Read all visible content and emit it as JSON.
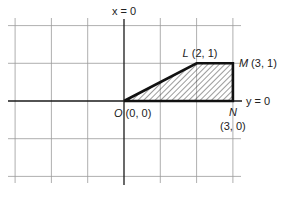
{
  "diagram": {
    "type": "coordinate-region",
    "axes": {
      "vertical_label": "x = 0",
      "horizontal_label": "y = 0"
    },
    "grid": {
      "x_range": [
        -3,
        3
      ],
      "y_range": [
        -2,
        2
      ],
      "step": 1
    },
    "region": {
      "shading": "hatched",
      "vertices": [
        {
          "name": "O",
          "coords": "(0, 0)",
          "x": 0,
          "y": 0
        },
        {
          "name": "L",
          "coords": "(2, 1)",
          "x": 2,
          "y": 1
        },
        {
          "name": "M",
          "coords": "(3, 1)",
          "x": 3,
          "y": 1
        },
        {
          "name": "N",
          "coords": "(3, 0)",
          "x": 3,
          "y": 0
        }
      ]
    },
    "colors": {
      "ink": "#111111",
      "grid": "#9a9a9a",
      "background": "#ffffff"
    }
  }
}
